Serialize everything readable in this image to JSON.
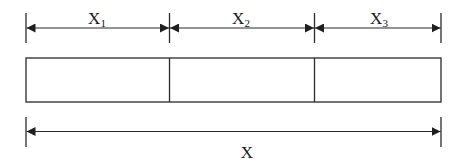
{
  "diagram": {
    "type": "dimension-diagram",
    "stroke_color": "#2a2a2a",
    "background": "#ffffff",
    "segments": [
      {
        "label": "X",
        "subscript": "1"
      },
      {
        "label": "X",
        "subscript": "2"
      },
      {
        "label": "X",
        "subscript": "3"
      }
    ],
    "total": {
      "label": "X"
    },
    "bar": {
      "cells": 3
    }
  }
}
